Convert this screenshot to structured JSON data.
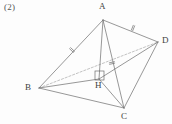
{
  "figure": {
    "problem_number": "(2)",
    "stroke_color": "#6b6b6b",
    "dashed_color": "#9a9a9a",
    "label_color": "#4a4a4a",
    "background_color": "#fdfdfd",
    "vertices": [
      {
        "name": "A",
        "label": "A",
        "x": 103,
        "y": 20,
        "label_x": 99,
        "label_y": 2
      },
      {
        "name": "B",
        "label": "B",
        "x": 39,
        "y": 88,
        "label_x": 25,
        "label_y": 83
      },
      {
        "name": "C",
        "label": "C",
        "x": 124,
        "y": 108,
        "label_x": 121,
        "label_y": 112
      },
      {
        "name": "D",
        "label": "D",
        "x": 158,
        "y": 42,
        "label_x": 162,
        "label_y": 36
      },
      {
        "name": "H",
        "label": "H",
        "x": 99,
        "y": 79,
        "label_x": 95,
        "label_y": 81
      }
    ],
    "solid_edges": [
      {
        "name": "edge-A-B",
        "from": "A",
        "to": "B"
      },
      {
        "name": "edge-A-C",
        "from": "A",
        "to": "C"
      },
      {
        "name": "edge-A-D",
        "from": "A",
        "to": "D"
      },
      {
        "name": "edge-A-H",
        "from": "A",
        "to": "H"
      },
      {
        "name": "edge-B-C",
        "from": "B",
        "to": "C"
      },
      {
        "name": "edge-B-H",
        "from": "B",
        "to": "H"
      },
      {
        "name": "edge-C-D",
        "from": "C",
        "to": "D"
      },
      {
        "name": "edge-H-C",
        "from": "H",
        "to": "C"
      },
      {
        "name": "edge-H-D",
        "from": "H",
        "to": "D"
      }
    ],
    "dashed_edges": [
      {
        "name": "edge-B-D",
        "from": "B",
        "to": "D"
      }
    ],
    "tick_marks": [
      {
        "name": "tick-edge-A-B",
        "edge": "A-B",
        "count": 2,
        "x": 72,
        "y": 50
      },
      {
        "name": "tick-edge-A-D",
        "edge": "A-D",
        "count": 2,
        "x": 133,
        "y": 28
      },
      {
        "name": "tick-edge-A-C",
        "edge": "A-C",
        "count": 2,
        "x": 112,
        "y": 63
      }
    ],
    "right_angle": {
      "name": "right-angle-at-H",
      "vertex": "H",
      "x": 95,
      "y": 71,
      "size": 9
    }
  }
}
